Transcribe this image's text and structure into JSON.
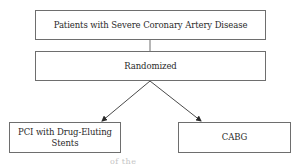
{
  "diagram": {
    "type": "flowchart",
    "nodes": [
      {
        "id": "population",
        "label": "Patients with Severe Coronary Artery Disease"
      },
      {
        "id": "randomized",
        "label": "Randomized"
      },
      {
        "id": "pci",
        "label": "PCI with Drug-Eluting Stents"
      },
      {
        "id": "cabg",
        "label": "CABG"
      }
    ],
    "edges": [
      {
        "from": "population",
        "to": "randomized",
        "style": "line"
      },
      {
        "from": "randomized",
        "to": "pci",
        "style": "arrow"
      },
      {
        "from": "randomized",
        "to": "cabg",
        "style": "arrow"
      }
    ],
    "caption_fragment": "of the"
  },
  "colors": {
    "border": "#6e6e6e",
    "text": "#2a2a2a",
    "background": "#ffffff"
  }
}
